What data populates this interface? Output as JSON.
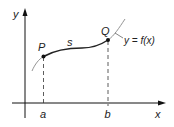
{
  "diagram": {
    "axes": {
      "x_label": "x",
      "y_label": "y"
    },
    "points": [
      {
        "label": "P",
        "x_tick": "a"
      },
      {
        "label": "Q",
        "x_tick": "b"
      }
    ],
    "arc_label": "s",
    "curve_label": "y = f(x)",
    "colors": {
      "axis": "#111111",
      "curve": "#222222",
      "curve_extension": "#888888",
      "dashed": "#333333",
      "text": "#222222"
    }
  }
}
